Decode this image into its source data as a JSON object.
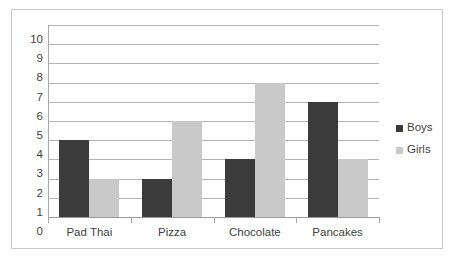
{
  "chart_data": {
    "type": "bar",
    "title": "",
    "subtitle": "",
    "xlabel": "",
    "ylabel": "",
    "categories": [
      "Pad Thai",
      "Pizza",
      "Chocolate",
      "Pancakes"
    ],
    "series": [
      {
        "name": "Boys",
        "color": "#3b3b3b",
        "values": [
          4,
          2,
          3,
          6
        ]
      },
      {
        "name": "Girls",
        "color": "#c9c9c9",
        "values": [
          2,
          5,
          7,
          3
        ]
      }
    ],
    "ylim": [
      0,
      10
    ],
    "ytick_labels": [
      "10",
      "9",
      "8",
      "7",
      "6",
      "5",
      "4",
      "3",
      "2",
      "1",
      "0"
    ],
    "ytick_values": [
      10,
      9,
      8,
      7,
      6,
      5,
      4,
      3,
      2,
      1,
      0
    ],
    "grid": true,
    "grid_axis": "y",
    "legend": true,
    "legend_position": "right",
    "legend_entries": [
      {
        "label": "Boys",
        "swatch_color": "#3b3b3b"
      },
      {
        "label": "Girls",
        "swatch_color": "#c9c9c9"
      }
    ],
    "plot_background": "#ffffff",
    "gridline_color": "#b4b4b4",
    "axis_color": "#a8a8a8",
    "frame_border_color": "#c9c9c9",
    "text_color": "#3f3f3f"
  }
}
